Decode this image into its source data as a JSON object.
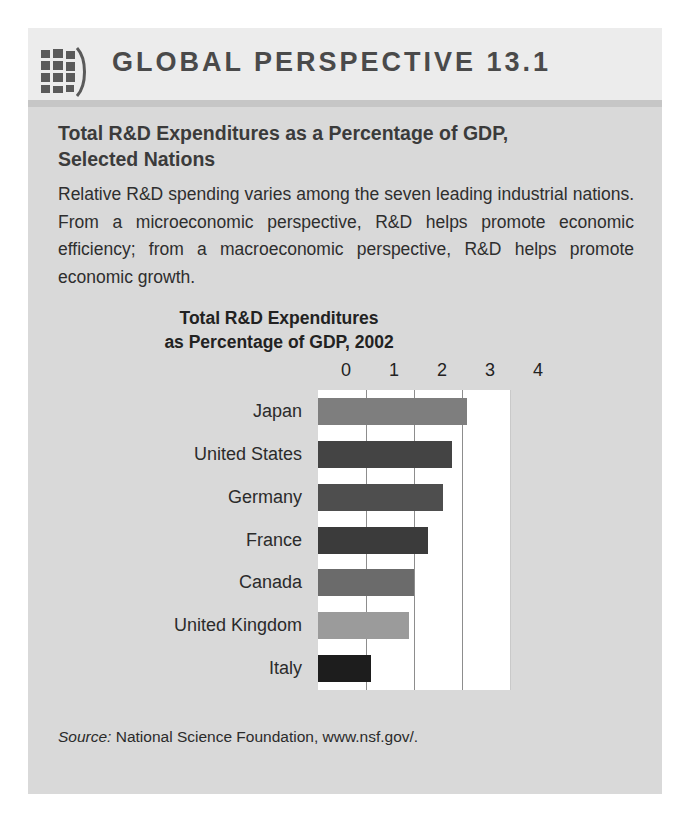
{
  "box": {
    "header": {
      "icon": "globe-icon",
      "title": "GLOBAL PERSPECTIVE 13.1"
    },
    "subtitle": "Total R&D Expenditures as a Percentage of GDP, Selected Nations",
    "body": "Relative R&D spending varies among the seven leading industrial nations. From a microeconomic perspective, R&D helps promote economic efficiency; from a macroeconomic perspective, R&D helps promote economic growth.",
    "source": {
      "label": "Source:",
      "text": " National Science Foundation, www.nsf.gov/."
    }
  },
  "chart_data": {
    "type": "bar",
    "orientation": "horizontal",
    "title": "Total R&D Expenditures\nas Percentage of GDP, 2002",
    "title_line1": "Total R&D Expenditures",
    "title_line2": "as Percentage of GDP, 2002",
    "xlabel": "",
    "ylabel": "",
    "xlim": [
      0,
      4
    ],
    "xticks": [
      0,
      1,
      2,
      3,
      4
    ],
    "xtick_labels": [
      "0",
      "1",
      "2",
      "3",
      "4"
    ],
    "grid": true,
    "legend": "none",
    "categories": [
      "Japan",
      "United States",
      "Germany",
      "France",
      "Canada",
      "United Kingdom",
      "Italy"
    ],
    "values": [
      3.1,
      2.8,
      2.6,
      2.3,
      2.0,
      1.9,
      1.1
    ],
    "bar_colors": [
      "#7e7e7e",
      "#444444",
      "#4e4e4e",
      "#3b3b3b",
      "#6b6b6b",
      "#9b9b9b",
      "#1d1d1d"
    ]
  }
}
